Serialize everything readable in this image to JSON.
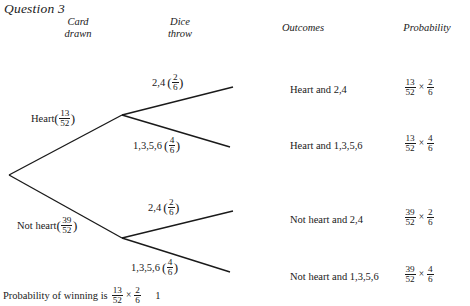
{
  "question_title": "Question 3",
  "headers": {
    "card": "Card\ndrawn",
    "card_line1": "Card",
    "card_line2": "drawn",
    "dice_line1": "Dice",
    "dice_line2": "throw",
    "outcomes": "Outcomes",
    "probability": "Probability"
  },
  "tree": {
    "first_stage": [
      {
        "label": "Heart",
        "prob_num": "13",
        "prob_den": "52"
      },
      {
        "label": "Not heart",
        "prob_num": "39",
        "prob_den": "52"
      }
    ],
    "second_stage": [
      {
        "label": "2,4",
        "prob_num": "2",
        "prob_den": "6"
      },
      {
        "label": "1,3,5,6",
        "prob_num": "4",
        "prob_den": "6"
      },
      {
        "label": "2,4",
        "prob_num": "2",
        "prob_den": "6"
      },
      {
        "label": "1,3,5,6",
        "prob_num": "4",
        "prob_den": "6"
      }
    ]
  },
  "rows": [
    {
      "outcome": "Heart and 2,4",
      "p1_num": "13",
      "p1_den": "52",
      "operator": "×",
      "p2_num": "2",
      "p2_den": "6"
    },
    {
      "outcome": "Heart and 1,3,5,6",
      "p1_num": "13",
      "p1_den": "52",
      "operator": "×",
      "p2_num": "4",
      "p2_den": "6"
    },
    {
      "outcome": "Not heart and 2,4",
      "p1_num": "39",
      "p1_den": "52",
      "operator": "×",
      "p2_num": "2",
      "p2_den": "6"
    },
    {
      "outcome": "Not heart and 1,3,5,6",
      "p1_num": "39",
      "p1_den": "52",
      "operator": "×",
      "p2_num": "4",
      "p2_den": "6"
    }
  ],
  "footer": {
    "text": "Probability of winning is",
    "f1_num": "13",
    "f1_den": "52",
    "operator": "×",
    "f2_num": "2",
    "f2_den": "6",
    "trailing": "1"
  },
  "paren_open": "(",
  "paren_close": ")"
}
